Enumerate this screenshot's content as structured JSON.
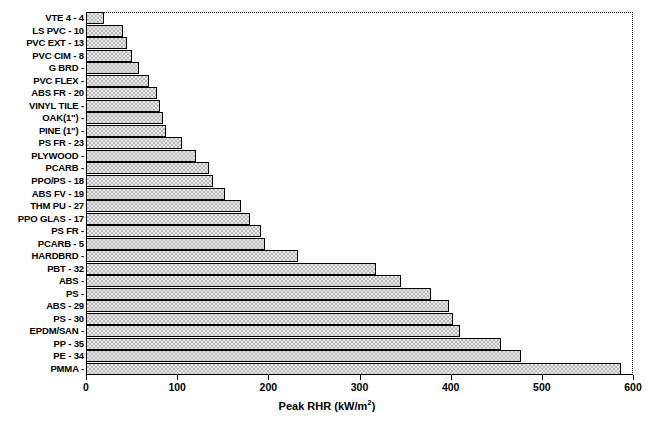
{
  "chart_data": {
    "type": "bar",
    "orientation": "horizontal",
    "title": "",
    "xlabel": "Peak RHR (kW/m2)",
    "xlabel_base": "Peak RHR (kW/m",
    "xlabel_sup": "2",
    "xlabel_tail": ")",
    "ylabel": "",
    "xlim": [
      0,
      600
    ],
    "xticks": [
      0,
      100,
      200,
      300,
      400,
      500,
      600
    ],
    "xtick_labels": [
      "0",
      "100",
      "200",
      "300",
      "400",
      "500",
      "600"
    ],
    "grid": false,
    "legend": null,
    "categories": [
      "VTE 4 - 4",
      "LS PVC - 10",
      "PVC EXT - 13",
      "PVC CIM - 8",
      "G BRD -",
      "PVC FLEX -",
      "ABS FR - 20",
      "VINYL TILE -",
      "OAK(1\") -",
      "PINE (1\") -",
      "PS FR - 23",
      "PLYWOOD -",
      "PCARB -",
      "PPO/PS - 18",
      "ABS FV - 19",
      "THM PU - 27",
      "PPO GLAS - 17",
      "PS FR -",
      "PCARB - 5",
      "HARDBRD -",
      "PBT - 32",
      "ABS -",
      "PS -",
      "ABS - 29",
      "PS - 30",
      "EPDM/SAN -",
      "PP - 35",
      "PE - 34",
      "PMMA -"
    ],
    "values": [
      20,
      41,
      45,
      50,
      58,
      69,
      78,
      81,
      85,
      88,
      105,
      121,
      135,
      139,
      152,
      170,
      180,
      192,
      196,
      233,
      318,
      345,
      378,
      398,
      403,
      410,
      455,
      477,
      587
    ],
    "bar_color": "#e8e8e8",
    "bar_pattern": "dotted-checker",
    "bar_edge_color": "#000000",
    "axis_color": "#000000",
    "plot_border_top_right": "dotted"
  }
}
